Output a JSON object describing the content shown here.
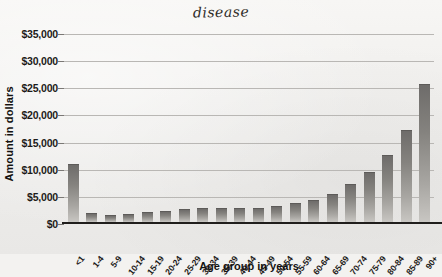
{
  "title_handwritten": "disease",
  "chart_data": {
    "type": "bar",
    "title": "disease",
    "xlabel": "Age group in years",
    "ylabel": "Amount in dollars",
    "categories": [
      "<1",
      "1-4",
      "5-9",
      "10-14",
      "15-19",
      "20-24",
      "25-29",
      "30-34",
      "35-39",
      "40-44",
      "45-49",
      "50-54",
      "55-59",
      "60-64",
      "65-69",
      "70-74",
      "75-79",
      "80-84",
      "85-89",
      "90+"
    ],
    "values": [
      10500,
      1400,
      1200,
      1300,
      1600,
      1800,
      2200,
      2400,
      2450,
      2450,
      2400,
      2800,
      3300,
      3900,
      5000,
      6900,
      9100,
      12200,
      16700,
      25200
    ],
    "values_note": "last bar 90+ = 30000",
    "ylim": [
      0,
      35000
    ],
    "yticks": [
      0,
      5000,
      10000,
      15000,
      20000,
      25000,
      30000,
      35000
    ],
    "ytick_labels": [
      "$0",
      "$5,000",
      "$10,000",
      "$15,000",
      "$20,000",
      "$25,000",
      "$30,000",
      "$35,000"
    ],
    "grid": true,
    "legend": "none",
    "bar_color": "#85837f"
  }
}
